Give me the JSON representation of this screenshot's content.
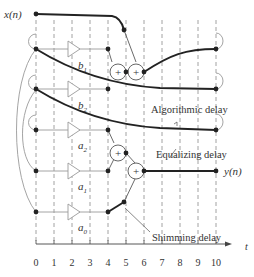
{
  "diagram": {
    "input_label": "x(n)",
    "output_label": "y(n)",
    "axis_label": "t",
    "time_ticks": [
      "0",
      "1",
      "2",
      "3",
      "4",
      "5",
      "6",
      "7",
      "8",
      "9",
      "10"
    ],
    "coefficients": {
      "b1": {
        "base": "b",
        "sub": "1"
      },
      "b2": {
        "base": "b",
        "sub": "2"
      },
      "a2": {
        "base": "a",
        "sub": "2"
      },
      "a1": {
        "base": "a",
        "sub": "1"
      },
      "a0": {
        "base": "a",
        "sub": "0"
      }
    },
    "annotations": {
      "algorithmic_delay": "Algorithmic delay",
      "equalizing_delay": "Equalizing delay",
      "shimming_delay": "Shimming delay"
    },
    "adder_symbol": "+",
    "colors": {
      "heavy_line": "#222222",
      "light_line": "#9a9a9a",
      "grid": "#8a8a8a",
      "text": "#333333"
    }
  }
}
